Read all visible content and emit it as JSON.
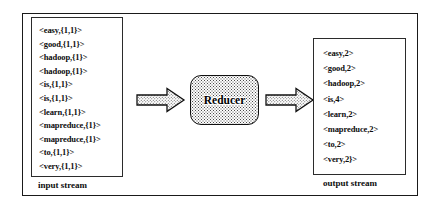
{
  "diagram": {
    "colors": {
      "frame": "#1a1a1a",
      "box_border": "#2b2b2b",
      "node_border": "#101010",
      "text": "#0d0d0d",
      "stipple": "#4a4a4a",
      "background": "#ffffff"
    }
  },
  "input_stream": {
    "caption": "input stream",
    "entries": [
      "<easy,{1,1}>",
      "<good,{1,1}>",
      "<hadoop,{1}>",
      "<hadoop,{1}>",
      "<is,{1,1}>",
      "<is,{1,1}>",
      "<learn,{1,1}>",
      "<mapreduce,{1}>",
      "<mapreduce,{1}>",
      "<to,{1,1}>",
      "<very,{1,1}>"
    ]
  },
  "reducer": {
    "label": "Reducer",
    "shape": "rounded-rectangle",
    "fill": "stippled"
  },
  "arrows": {
    "input_to_reducer": {
      "name": "arrow-input-to-reducer",
      "direction": "right",
      "fill": "stippled"
    },
    "reducer_to_output": {
      "name": "arrow-reducer-to-output",
      "direction": "right",
      "fill": "stippled"
    }
  },
  "output_stream": {
    "caption": "output stream",
    "entries": [
      "<easy,2>",
      "<good,2>",
      "<hadoop,2>",
      "<is,4>",
      "<learn,2>",
      "<mapreduce,2>",
      "<to,2>",
      "<very,2}>"
    ]
  }
}
